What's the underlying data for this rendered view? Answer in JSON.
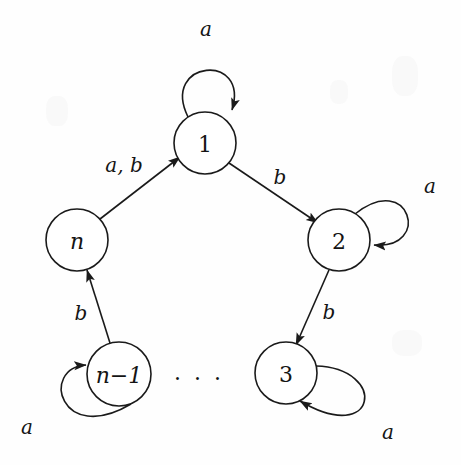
{
  "figure": {
    "kind": "finite-automaton-state-diagram",
    "width": 461,
    "height": 465,
    "background_color": "#fefefe",
    "ink_color": "#1a1a1a"
  },
  "states": [
    {
      "id": "1",
      "label": "1",
      "cx": 205,
      "cy": 143,
      "r": 31,
      "italic": false
    },
    {
      "id": "2",
      "label": "2",
      "cx": 339,
      "cy": 240,
      "r": 31,
      "italic": false
    },
    {
      "id": "3",
      "label": "3",
      "cx": 286,
      "cy": 373,
      "r": 31,
      "italic": false
    },
    {
      "id": "n-1",
      "label": "n−1",
      "cx": 119,
      "cy": 374,
      "r": 32,
      "italic": true
    },
    {
      "id": "n",
      "label": "n",
      "cx": 77,
      "cy": 240,
      "r": 31,
      "italic": true
    }
  ],
  "transitions": [
    {
      "id": "t-n-to-1",
      "from": "n",
      "to": "1",
      "label": "a, b",
      "label_x": 124,
      "label_y": 165
    },
    {
      "id": "t-1-to-2",
      "from": "1",
      "to": "2",
      "label": "b",
      "label_x": 280,
      "label_y": 177
    },
    {
      "id": "t-2-to-3",
      "from": "2",
      "to": "3",
      "label": "b",
      "label_x": 329,
      "label_y": 312
    },
    {
      "id": "t-nm1-to-n",
      "from": "n-1",
      "to": "n",
      "label": "b",
      "label_x": 81,
      "label_y": 313
    }
  ],
  "self_loops": [
    {
      "id": "loop-1",
      "state": "1",
      "label": "a",
      "label_x": 206,
      "label_y": 29
    },
    {
      "id": "loop-2",
      "state": "2",
      "label": "a",
      "label_x": 430,
      "label_y": 186
    },
    {
      "id": "loop-3",
      "state": "3",
      "label": "a",
      "label_x": 388,
      "label_y": 432
    },
    {
      "id": "loop-n-1",
      "state": "n-1",
      "label": "a",
      "label_x": 27,
      "label_y": 427
    }
  ],
  "annotations": [
    {
      "id": "ellipsis",
      "text": "· · ·",
      "x": 199,
      "y": 378
    }
  ]
}
